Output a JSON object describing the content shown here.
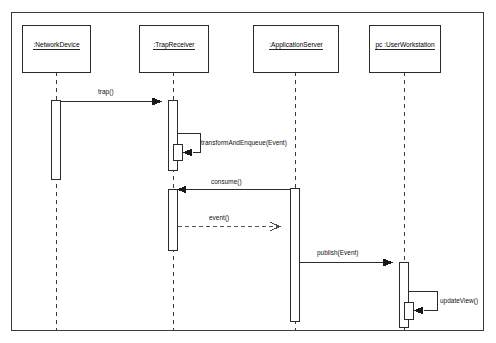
{
  "diagram": {
    "type": "uml-sequence-diagram",
    "frame": {
      "x": 11,
      "y": 12,
      "width": 473,
      "height": 319
    },
    "background_color": "#ffffff",
    "line_color": "#222222",
    "text_color": "#0f0f0f",
    "lifelines": [
      {
        "id": "network-device",
        "label": ":NetworkDevice",
        "box": {
          "x": 22,
          "y": 25,
          "width": 68,
          "height": 47
        },
        "center_x": 56,
        "lifeline_top": 72,
        "lifeline_bottom": 331
      },
      {
        "id": "trap-receiver",
        "label": ":TrapReceiver",
        "box": {
          "x": 139,
          "y": 25,
          "width": 69,
          "height": 47
        },
        "center_x": 173,
        "lifeline_top": 72,
        "lifeline_bottom": 331
      },
      {
        "id": "application-server",
        "label": ":ApplicationServer",
        "box": {
          "x": 253,
          "y": 25,
          "width": 85,
          "height": 47
        },
        "center_x": 295,
        "lifeline_top": 72,
        "lifeline_bottom": 331
      },
      {
        "id": "user-workstation",
        "label": "pc :UserWorkstation",
        "box": {
          "x": 369,
          "y": 25,
          "width": 71,
          "height": 47
        },
        "center_x": 404,
        "lifeline_top": 72,
        "lifeline_bottom": 331
      }
    ],
    "activations": [
      {
        "id": "act-network-device",
        "lifeline": "network-device",
        "x": 51,
        "y": 100,
        "width": 9,
        "height": 79
      },
      {
        "id": "act-trap-receiver-1",
        "lifeline": "trap-receiver",
        "x": 168,
        "y": 100,
        "width": 9,
        "height": 70
      },
      {
        "id": "act-trap-receiver-self",
        "lifeline": "trap-receiver",
        "x": 173,
        "y": 144,
        "width": 9,
        "height": 16
      },
      {
        "id": "act-trap-receiver-2",
        "lifeline": "trap-receiver",
        "x": 168,
        "y": 189,
        "width": 9,
        "height": 61
      },
      {
        "id": "act-application-server",
        "lifeline": "application-server",
        "x": 290,
        "y": 188,
        "width": 9,
        "height": 133
      },
      {
        "id": "act-user-workstation",
        "lifeline": "user-workstation",
        "x": 399,
        "y": 262,
        "width": 9,
        "height": 65
      },
      {
        "id": "act-user-workstation-self",
        "lifeline": "user-workstation",
        "x": 404,
        "y": 302,
        "width": 9,
        "height": 17
      }
    ],
    "messages": [
      {
        "id": "msg-trap",
        "label": "trap()",
        "from": "network-device",
        "to": "trap-receiver",
        "kind": "call",
        "style": "solid",
        "arrow": "filled",
        "direction": "right",
        "y": 101,
        "x1": 60,
        "x2": 169,
        "label_x": 112,
        "label_y": 92
      },
      {
        "id": "msg-transform-and-enqueue",
        "label": "transformAndEnqueue(Event)",
        "from": "trap-receiver",
        "to": "trap-receiver",
        "kind": "self-call",
        "style": "solid",
        "arrow": "filled",
        "direction": "self",
        "y": 133,
        "label_x": 201,
        "label_y": 141
      },
      {
        "id": "msg-consume",
        "label": "consume()",
        "from": "application-server",
        "to": "trap-receiver",
        "kind": "call",
        "style": "solid",
        "arrow": "filled",
        "direction": "left",
        "y": 189,
        "x1": 290,
        "x2": 177,
        "label_x": 231,
        "label_y": 181
      },
      {
        "id": "msg-event",
        "label": "event()",
        "from": "trap-receiver",
        "to": "application-server",
        "kind": "return",
        "style": "dashed",
        "arrow": "open",
        "direction": "right",
        "y": 226,
        "x1": 177,
        "x2": 289,
        "label_x": 224,
        "label_y": 218
      },
      {
        "id": "msg-publish",
        "label": "publish(Event)",
        "from": "application-server",
        "to": "user-workstation",
        "kind": "call",
        "style": "solid",
        "arrow": "filled",
        "direction": "right",
        "y": 262,
        "x1": 299,
        "x2": 400,
        "label_x": 342,
        "label_y": 253
      },
      {
        "id": "msg-update-view",
        "label": "updateView()",
        "from": "user-workstation",
        "to": "user-workstation",
        "kind": "self-call",
        "style": "solid",
        "arrow": "filled",
        "direction": "self",
        "y": 291,
        "label_x": 440,
        "label_y": 299
      }
    ]
  }
}
